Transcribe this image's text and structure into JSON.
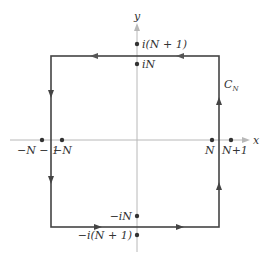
{
  "diagram": {
    "axes": {
      "x_label": "x",
      "y_label": "y"
    },
    "contour": {
      "label_main": "C",
      "label_sub": "N",
      "direction": "counterclockwise"
    },
    "points": {
      "top_outer": "i(N + 1)",
      "top_inner": "iN",
      "bottom_inner": "−iN",
      "bottom_outer": "−i(N + 1)",
      "left_outer": "−N − 1",
      "left_inner": "−N",
      "right_inner": "N",
      "right_outer": "N+1"
    },
    "colors": {
      "contour": "#444444",
      "axis": "#b8b8b8",
      "text": "#333333"
    }
  }
}
